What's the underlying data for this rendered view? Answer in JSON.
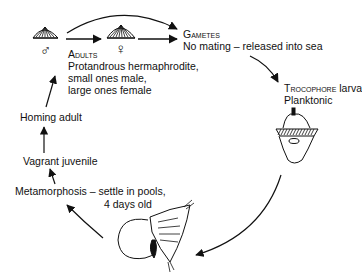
{
  "diagram": {
    "type": "life-cycle",
    "stages": {
      "adults": {
        "heading": "Adults",
        "lines": [
          "Protandrous hermaphrodite,",
          "small ones male,",
          "large ones female"
        ],
        "male_symbol": "♂",
        "female_symbol": "♀"
      },
      "gametes": {
        "heading": "Gametes",
        "description": "No mating – released into sea"
      },
      "trocophore": {
        "heading": "Trocophore",
        "heading_suffix": " larva",
        "description": "Planktonic"
      },
      "metamorphosis": {
        "line1": "Metamorphosis – settle in pools,",
        "line2": "4 days old"
      },
      "vagrant": {
        "label": "Vagrant juvenile"
      },
      "homing": {
        "label": "Homing adult"
      }
    },
    "colors": {
      "ink": "#111111",
      "background": "#ffffff"
    }
  }
}
